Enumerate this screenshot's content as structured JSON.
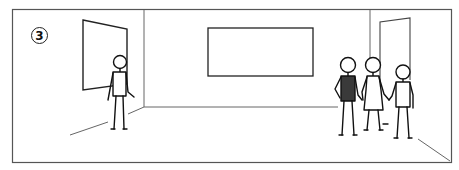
{
  "illustration": {
    "description": "Line-drawing of a room: one person standing near a window on the left, a group of three people entering through a door on the right, blank screen on back wall",
    "step_number": "3",
    "colors": {
      "line": "#222222",
      "frame": "#555555",
      "shirt_dark": "#3a3a3a",
      "background": "#ffffff"
    },
    "elements": {
      "left_window": "window",
      "center_screen": "blank screen",
      "right_door": "open doorway",
      "person_left": "person standing alone",
      "group": [
        "person in dark shirt",
        "person in dress",
        "person"
      ]
    }
  }
}
